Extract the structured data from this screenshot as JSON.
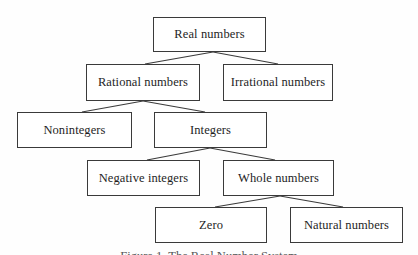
{
  "diagram": {
    "type": "tree",
    "nodes": [
      {
        "id": "real",
        "label": "Real numbers",
        "x": 153,
        "y": 17,
        "w": 113,
        "h": 35
      },
      {
        "id": "rational",
        "label": "Rational numbers",
        "x": 86,
        "y": 64,
        "w": 114,
        "h": 37
      },
      {
        "id": "irrational",
        "label": "Irrational numbers",
        "x": 223,
        "y": 64,
        "w": 110,
        "h": 37
      },
      {
        "id": "nonintegers",
        "label": "Nonintegers",
        "x": 17,
        "y": 112,
        "w": 115,
        "h": 36
      },
      {
        "id": "integers",
        "label": "Integers",
        "x": 154,
        "y": 112,
        "w": 113,
        "h": 36
      },
      {
        "id": "negative",
        "label": "Negative integers",
        "x": 87,
        "y": 160,
        "w": 113,
        "h": 36
      },
      {
        "id": "whole",
        "label": "Whole numbers",
        "x": 223,
        "y": 160,
        "w": 111,
        "h": 36
      },
      {
        "id": "zero",
        "label": "Zero",
        "x": 155,
        "y": 207,
        "w": 112,
        "h": 36
      },
      {
        "id": "natural",
        "label": "Natural numbers",
        "x": 290,
        "y": 207,
        "w": 113,
        "h": 36
      }
    ],
    "edges": [
      {
        "from": "real",
        "to": "rational",
        "x1": 213,
        "y1": 52,
        "x2": 145,
        "y2": 64
      },
      {
        "from": "real",
        "to": "irrational",
        "x1": 213,
        "y1": 52,
        "x2": 278,
        "y2": 64
      },
      {
        "from": "rational",
        "to": "nonintegers",
        "x1": 143,
        "y1": 101,
        "x2": 82,
        "y2": 112
      },
      {
        "from": "rational",
        "to": "integers",
        "x1": 143,
        "y1": 101,
        "x2": 205,
        "y2": 112
      },
      {
        "from": "integers",
        "to": "negative",
        "x1": 210,
        "y1": 148,
        "x2": 147,
        "y2": 160
      },
      {
        "from": "integers",
        "to": "whole",
        "x1": 210,
        "y1": 148,
        "x2": 275,
        "y2": 160
      },
      {
        "from": "whole",
        "to": "zero",
        "x1": 280,
        "y1": 196,
        "x2": 215,
        "y2": 207
      },
      {
        "from": "whole",
        "to": "natural",
        "x1": 280,
        "y1": 196,
        "x2": 343,
        "y2": 207
      }
    ],
    "caption": "Figure 1. The Real Number System",
    "colors": {
      "line": "#3a3a3a",
      "box_border": "#3a3a3a",
      "text": "#1e1e1e",
      "background": "#fefefe"
    }
  }
}
